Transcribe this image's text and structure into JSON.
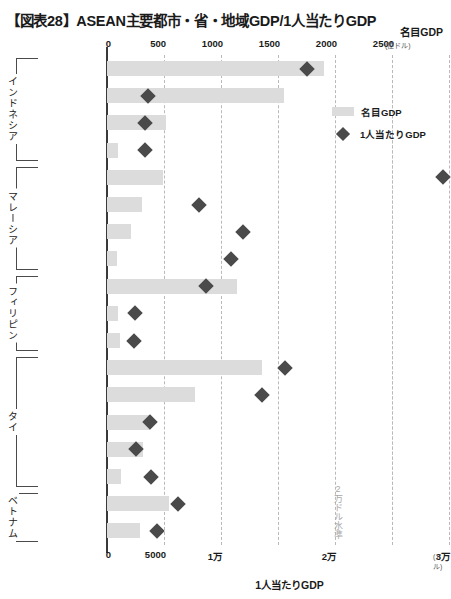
{
  "title": "【図表28】ASEAN主要都市・省・地域GDP/1人当たりGDP",
  "axes": {
    "top_caption": "名目GDP",
    "top_unit": "(億ドル)",
    "bottom_caption": "1人当たりGDP",
    "bottom_unit": "(ドル)",
    "top_ticks": [
      "0",
      "500",
      "1000",
      "1500",
      "2000",
      "2500"
    ],
    "bottom_ticks": [
      "0",
      "5000",
      "1万",
      "",
      "2万",
      "",
      "3万"
    ]
  },
  "legend": {
    "bar_label": "名目GDP",
    "diamond_label": "1人当たりGDP"
  },
  "annotation": "2万ドル水準",
  "groups": [
    {
      "name": "インドネシア",
      "count": 4
    },
    {
      "name": "マレーシア",
      "count": 4
    },
    {
      "name": "フィリピン",
      "count": 3
    },
    {
      "name": "タイ",
      "count": 5
    },
    {
      "name": "ベトナム",
      "count": 2
    }
  ],
  "colors": {
    "bar": "#dcdcdc",
    "diamond": "#4a4a4a",
    "axis": "#3a3a3a",
    "grid": "#b9b9b9",
    "annotation": "#a8a8a8"
  },
  "chart_data": {
    "type": "bar",
    "title": "【図表28】ASEAN主要都市・省・地域GDP/1人当たりGDP",
    "xlabel": "名目GDP（億ドル） / 1人当たりGDP（ドル）",
    "ylabel": "",
    "orientation": "horizontal",
    "legend_position": "top-right",
    "grid": true,
    "top_axis": {
      "label": "名目GDP",
      "unit": "億ドル",
      "ticks": [
        0,
        500,
        1000,
        1500,
        2000,
        2500
      ],
      "range": [
        0,
        2950
      ]
    },
    "bottom_axis": {
      "label": "1人当たりGDP",
      "unit": "ドル",
      "ticks": [
        0,
        5000,
        10000,
        20000,
        30000
      ],
      "range": [
        0,
        29500
      ]
    },
    "categories": [
      "ジャカルタ",
      "東ジャワ",
      "北スマトラ",
      "中部カリマンタン",
      "クアラルンプール",
      "ジョホール",
      "ペナン",
      "マラッカ",
      "マニラ",
      "ダバオ地方",
      "北ミンダナオ",
      "バンコク",
      "タイ東部",
      "タイ南部",
      "タイ北部",
      "タイ西部",
      "ホーチミン市",
      "ハノイ"
    ],
    "series": [
      {
        "name": "名目GDP",
        "unit": "億ドル",
        "type": "bar",
        "values": [
          1900,
          1550,
          520,
          100,
          490,
          310,
          210,
          90,
          1140,
          100,
          110,
          1360,
          770,
          380,
          320,
          120,
          540,
          290
        ]
      },
      {
        "name": "1人当たりGDP",
        "unit": "ドル",
        "type": "scatter",
        "values": [
          17500,
          3600,
          3350,
          3350,
          29500,
          8100,
          11900,
          10900,
          8700,
          2450,
          2400,
          15600,
          13600,
          3800,
          2550,
          3900,
          6200,
          4400
        ]
      }
    ],
    "annotations": [
      {
        "text": "2万ドル水準",
        "axis": "bottom",
        "value": 20000
      }
    ]
  }
}
